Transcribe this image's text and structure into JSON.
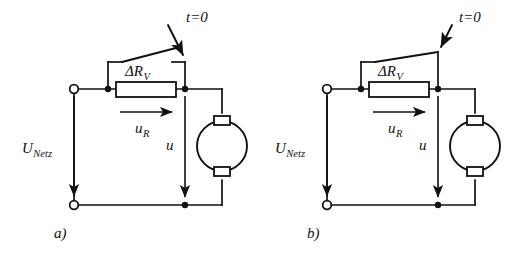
{
  "figure": {
    "type": "circuit-diagram",
    "ink_color": "#111111",
    "background_color": "#ffffff",
    "panel_count": 2
  },
  "panels": [
    {
      "id": "a",
      "caption": "a)",
      "switch_state": "open",
      "labels": {
        "switch": "t=0",
        "resistor": "ΔR",
        "resistor_subscript": "V",
        "resistor_voltage": "u",
        "resistor_voltage_subscript": "R",
        "motor_voltage": "u",
        "supply": "U",
        "supply_subscript": "Netz"
      }
    },
    {
      "id": "b",
      "caption": "b)",
      "switch_state": "closed",
      "labels": {
        "switch": "t=0",
        "resistor": "ΔR",
        "resistor_subscript": "V",
        "resistor_voltage": "u",
        "resistor_voltage_subscript": "R",
        "motor_voltage": "u",
        "supply": "U",
        "supply_subscript": "Netz"
      }
    }
  ],
  "components": {
    "resistor_name": "series-starting-resistor",
    "switch_name": "bypass-switch",
    "machine_name": "dc-motor",
    "terminal_name": "supply-terminal",
    "junction_name": "wire-junction"
  }
}
